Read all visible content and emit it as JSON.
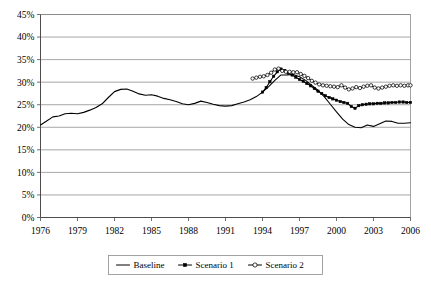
{
  "chart_data": {
    "type": "line",
    "title": "",
    "xlabel": "",
    "ylabel": "",
    "xlim": [
      1976,
      2006
    ],
    "ylim": [
      0,
      45
    ],
    "ytick_labels": [
      "0%",
      "5%",
      "10%",
      "15%",
      "20%",
      "25%",
      "30%",
      "35%",
      "40%",
      "45%"
    ],
    "ytick_values": [
      0,
      5,
      10,
      15,
      20,
      25,
      30,
      35,
      40,
      45
    ],
    "xtick_labels": [
      "1976",
      "1979",
      "1982",
      "1985",
      "1988",
      "1991",
      "1994",
      "1997",
      "2000",
      "2003",
      "2006"
    ],
    "xtick_values": [
      1976,
      1979,
      1982,
      1985,
      1988,
      1991,
      1994,
      1997,
      2000,
      2003,
      2006
    ],
    "grid": "horizontal",
    "legend_position": "bottom",
    "legend": [
      "Baseline",
      "Scenario 1",
      "Scenario 2"
    ],
    "units": "percent",
    "series": [
      {
        "name": "Baseline",
        "marker": "none",
        "x": [
          1976,
          1976.5,
          1977,
          1977.5,
          1978,
          1978.5,
          1979,
          1979.5,
          1980,
          1980.5,
          1981,
          1981.5,
          1982,
          1982.5,
          1983,
          1983.5,
          1984,
          1984.5,
          1985,
          1985.5,
          1986,
          1986.5,
          1987,
          1987.5,
          1988,
          1988.5,
          1989,
          1989.5,
          1990,
          1990.5,
          1991,
          1991.5,
          1992,
          1992.5,
          1993,
          1993.5,
          1994,
          1994.5,
          1995,
          1995.5,
          1996,
          1996.5,
          1997,
          1997.5,
          1998,
          1998.5,
          1999,
          1999.5,
          2000,
          2000.5,
          2001,
          2001.5,
          2002,
          2002.5,
          2003,
          2003.5,
          2004,
          2004.5,
          2005,
          2005.5,
          2006
        ],
        "values": [
          20.5,
          21.4,
          22.3,
          22.5,
          23.0,
          23.1,
          23.0,
          23.3,
          23.8,
          24.4,
          25.2,
          26.6,
          27.9,
          28.4,
          28.5,
          28.0,
          27.4,
          27.1,
          27.2,
          26.9,
          26.4,
          26.1,
          25.7,
          25.2,
          25.0,
          25.3,
          25.8,
          25.5,
          25.1,
          24.8,
          24.7,
          24.8,
          25.2,
          25.6,
          26.1,
          26.8,
          27.8,
          29.0,
          30.4,
          31.6,
          31.6,
          31.7,
          31.2,
          30.4,
          29.3,
          28.2,
          26.8,
          25.1,
          23.4,
          21.8,
          20.6,
          20.0,
          19.9,
          20.5,
          20.2,
          20.8,
          21.4,
          21.3,
          20.9,
          20.9,
          21.0
        ]
      },
      {
        "name": "Scenario 1",
        "marker": "filled-square",
        "x": [
          1994,
          1994.3,
          1994.6,
          1994.9,
          1995.2,
          1995.5,
          1995.8,
          1996.1,
          1996.4,
          1996.7,
          1997,
          1997.3,
          1997.6,
          1997.9,
          1998.2,
          1998.5,
          1998.8,
          1999.1,
          1999.4,
          1999.7,
          2000,
          2000.3,
          2000.6,
          2000.9,
          2001.2,
          2001.5,
          2001.8,
          2002.1,
          2002.4,
          2002.7,
          2003,
          2003.3,
          2003.6,
          2003.9,
          2004.2,
          2004.5,
          2004.8,
          2005.1,
          2005.4,
          2005.7,
          2006
        ],
        "values": [
          27.8,
          28.8,
          30.1,
          31.3,
          32.3,
          32.9,
          32.6,
          32.0,
          31.6,
          31.1,
          30.6,
          30.2,
          29.7,
          29.2,
          28.6,
          28.0,
          27.5,
          27.0,
          26.6,
          26.3,
          26.0,
          25.7,
          25.5,
          25.3,
          24.6,
          24.2,
          24.8,
          25.0,
          25.1,
          25.2,
          25.2,
          25.3,
          25.3,
          25.4,
          25.4,
          25.5,
          25.5,
          25.6,
          25.6,
          25.5,
          25.5
        ]
      },
      {
        "name": "Scenario 2",
        "marker": "open-circle",
        "x": [
          1993.2,
          1993.5,
          1993.8,
          1994.1,
          1994.4,
          1994.7,
          1995,
          1995.3,
          1995.6,
          1995.9,
          1996.2,
          1996.5,
          1996.8,
          1997.1,
          1997.4,
          1997.7,
          1998,
          1998.3,
          1998.6,
          1998.9,
          1999.2,
          1999.5,
          1999.8,
          2000.1,
          2000.4,
          2000.7,
          2001,
          2001.3,
          2001.6,
          2001.9,
          2002.2,
          2002.5,
          2002.8,
          2003.1,
          2003.4,
          2003.7,
          2004,
          2004.3,
          2004.6,
          2004.9,
          2005.2,
          2005.5,
          2005.8,
          2006
        ],
        "values": [
          30.8,
          31.0,
          31.2,
          31.3,
          31.6,
          32.1,
          32.8,
          33.0,
          32.5,
          32.3,
          32.3,
          32.2,
          32.2,
          31.8,
          31.4,
          30.9,
          30.3,
          29.9,
          29.5,
          29.3,
          29.2,
          29.1,
          29.0,
          28.9,
          29.3,
          28.8,
          28.4,
          28.6,
          28.9,
          28.7,
          29.0,
          29.2,
          29.3,
          28.8,
          28.6,
          28.8,
          29.0,
          29.2,
          29.3,
          29.2,
          29.3,
          29.2,
          29.3,
          29.3
        ]
      }
    ]
  },
  "legend": {
    "items": [
      {
        "label": "Baseline",
        "marker": "none"
      },
      {
        "label": "Scenario 1",
        "marker": "filled-square"
      },
      {
        "label": "Scenario 2",
        "marker": "open-circle"
      }
    ]
  }
}
